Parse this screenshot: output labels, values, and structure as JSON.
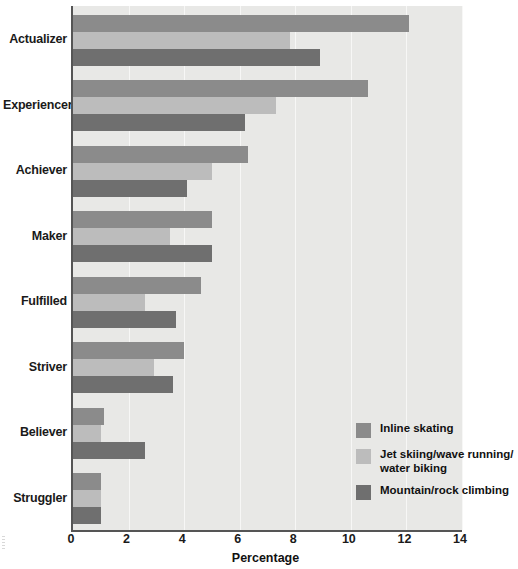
{
  "chart_data": {
    "type": "bar",
    "orientation": "horizontal",
    "title": "",
    "xlabel": "Percentage",
    "ylabel": "",
    "xlim": [
      0,
      14
    ],
    "xticks": [
      0,
      2,
      4,
      6,
      8,
      10,
      12,
      14
    ],
    "grid": true,
    "legend_position": "inside-lower-right",
    "categories": [
      "Actualizer",
      "Experiencer",
      "Achiever",
      "Maker",
      "Fulfilled",
      "Striver",
      "Believer",
      "Struggler"
    ],
    "series": [
      {
        "name": "Inline skating",
        "color": "#8b8b8b",
        "values": [
          12.1,
          10.6,
          6.3,
          5.0,
          4.6,
          4.0,
          1.1,
          1.0
        ]
      },
      {
        "name": "Jet skiing/wave running/water biking",
        "color": "#bcbcbc",
        "values": [
          7.8,
          7.3,
          5.0,
          3.5,
          2.6,
          2.9,
          1.0,
          1.0
        ]
      },
      {
        "name": "Mountain/rock climbing",
        "color": "#6f6f6f",
        "values": [
          8.9,
          6.2,
          4.1,
          5.0,
          3.7,
          3.6,
          2.6,
          1.0
        ]
      }
    ],
    "legend_entries": [
      {
        "label": "Inline skating",
        "label_line2": "",
        "color": "#8b8b8b"
      },
      {
        "label": "Jet skiing/wave running/",
        "label_line2": "water biking",
        "color": "#bcbcbc"
      },
      {
        "label": "Mountain/rock climbing",
        "label_line2": "",
        "color": "#6f6f6f"
      }
    ],
    "colors": {
      "plot_background": "#e8e8e6",
      "axis": "#555555",
      "gridline": "#f7f7f6",
      "text": "#1a1a1a"
    }
  }
}
